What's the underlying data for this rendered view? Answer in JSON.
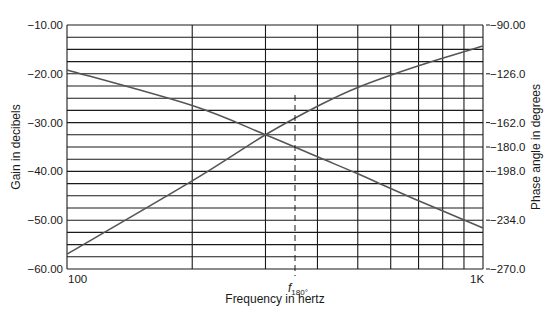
{
  "chart_data": {
    "type": "line",
    "title": "",
    "xlabel": "Frequency in hertz",
    "ylabel": "Gain in decibels",
    "y2label": "Phase angle in degrees",
    "xscale": "log",
    "xlim": [
      100,
      1000
    ],
    "ylim": [
      -60,
      -10
    ],
    "y2lim": [
      -270,
      -90
    ],
    "x_tick_labels": [
      "100",
      "1K"
    ],
    "y_tick_labels": [
      "-10.00",
      "-20.00",
      "-30.00",
      "-40.00",
      "-50.00",
      "-60.00"
    ],
    "y2_tick_labels": [
      "-90.00",
      "-126.0",
      "-162.0",
      "-180.0",
      "-198.0",
      "-234.0",
      "-270.0"
    ],
    "grid": true,
    "annotation": {
      "label": "f",
      "subscript": "180°",
      "x": 330,
      "style": "dashed vertical line"
    },
    "series": [
      {
        "name": "Gain (dB)",
        "axis": "left",
        "x": [
          100,
          200,
          300,
          400,
          500,
          700,
          1000
        ],
        "values": [
          -19.2,
          -26.5,
          -32.5,
          -37.0,
          -40.5,
          -46.0,
          -51.6
        ]
      },
      {
        "name": "Phase (deg)",
        "axis": "right",
        "x": [
          100,
          200,
          300,
          400,
          500,
          700,
          1000
        ],
        "values": [
          -259,
          -205,
          -171,
          -150,
          -136,
          -120,
          -105.5
        ]
      }
    ]
  },
  "labels": {
    "y_left": "Gain in decibels",
    "y_right": "Phase angle in degrees",
    "x": "Frequency in hertz",
    "x_min": "100",
    "x_max": "1K",
    "f_main": "f",
    "f_sub": "180°"
  },
  "colors": {
    "grid": "#1a1a1a",
    "curve": "#555555",
    "text": "#1a1a1a"
  }
}
